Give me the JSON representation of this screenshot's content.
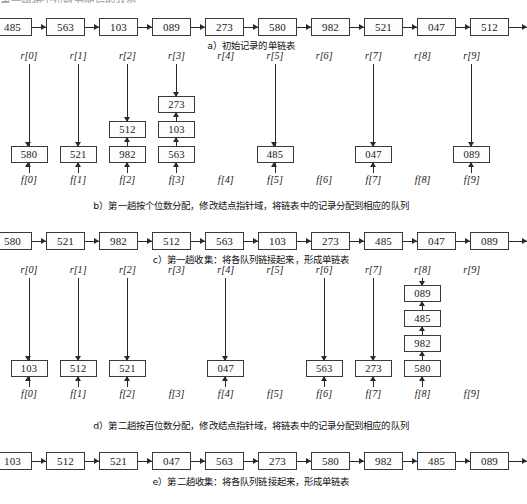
{
  "top_clipped_text": "第一趟按个位数分配后的状态",
  "figure": {
    "index_prefix_r": "r",
    "index_prefix_f": "f",
    "bracket_open": "[",
    "bracket_close": "]",
    "bucket_count": 10
  },
  "sections": {
    "a": {
      "caption": "a）初始记录的单链表",
      "nodes": [
        "485",
        "563",
        "103",
        "089",
        "273",
        "580",
        "982",
        "521",
        "047",
        "512"
      ]
    },
    "b": {
      "caption": "b）第一趟按个位数分配，修改结点指针域，将链表中的记录分配到相应的队列",
      "r_labels": [
        "r[0]",
        "r[1]",
        "r[2]",
        "r[3]",
        "r[4]",
        "r[5]",
        "r[6]",
        "r[7]",
        "r[8]",
        "r[9]"
      ],
      "f_labels": [
        "f[0]",
        "f[1]",
        "f[2]",
        "f[3]",
        "f[4]",
        "f[5]",
        "f[6]",
        "f[7]",
        "f[8]",
        "f[9]"
      ],
      "queues": [
        [
          "580"
        ],
        [
          "521"
        ],
        [
          "512",
          "982"
        ],
        [
          "273",
          "103",
          "563"
        ],
        [],
        [
          "485"
        ],
        [],
        [
          "047"
        ],
        [],
        [
          "089"
        ]
      ]
    },
    "c": {
      "caption": "c）第一趟收集：将各队列链接起来，形成单链表",
      "nodes": [
        "580",
        "521",
        "982",
        "512",
        "563",
        "103",
        "273",
        "485",
        "047",
        "089"
      ]
    },
    "d": {
      "caption": "d）第二趟按百位数分配，修改结点指针域，将链表中的记录分配到相应的队列",
      "r_labels": [
        "r[0]",
        "r[1]",
        "r[2]",
        "r[3]",
        "r[4]",
        "r[5]",
        "r[6]",
        "r[7]",
        "r[8]",
        "r[9]"
      ],
      "f_labels": [
        "f[0]",
        "f[1]",
        "f[2]",
        "f[3]",
        "f[4]",
        "f[5]",
        "f[6]",
        "f[7]",
        "f[8]",
        "f[9]"
      ],
      "queues": [
        [
          "103"
        ],
        [
          "512"
        ],
        [
          "521"
        ],
        [],
        [
          "047"
        ],
        [],
        [
          "563"
        ],
        [
          "273"
        ],
        [
          "089",
          "485",
          "982",
          "580"
        ],
        []
      ]
    },
    "e": {
      "caption": "e）第二趟收集：将各队列链接起来，形成单链表",
      "nodes": [
        "103",
        "512",
        "521",
        "047",
        "563",
        "273",
        "580",
        "982",
        "485",
        "089"
      ]
    }
  },
  "colors": {
    "ink": "#1a1a1a",
    "box_border": "#3a3a3a",
    "background": "#ffffff"
  }
}
